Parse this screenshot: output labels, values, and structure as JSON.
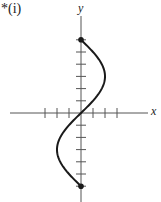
{
  "part_label": "*(i)",
  "chart_data": {
    "type": "line",
    "title": "",
    "xlabel": "x",
    "ylabel": "y",
    "xlim": [
      -3,
      3
    ],
    "ylim": [
      -6,
      6
    ],
    "x_ticks": [
      -3,
      -2,
      -1,
      1,
      2,
      3
    ],
    "y_ticks": [
      -6,
      -5,
      -4,
      -3,
      -2,
      -1,
      1,
      2,
      3,
      4,
      5,
      6
    ],
    "tick_labels_shown": false,
    "grid": false,
    "curve": "x = 2 sin(pi*y/6), -6 <= y <= 6",
    "series": [
      {
        "name": "curve",
        "points": [
          [
            0,
            -6
          ],
          [
            -1,
            -5
          ],
          [
            -1.73,
            -4
          ],
          [
            -2,
            -3
          ],
          [
            -1.73,
            -2
          ],
          [
            -1,
            -1
          ],
          [
            0,
            0
          ],
          [
            1,
            1
          ],
          [
            1.73,
            2
          ],
          [
            2,
            3
          ],
          [
            1.73,
            4
          ],
          [
            1,
            5
          ],
          [
            0,
            6
          ]
        ]
      }
    ],
    "endpoints": [
      [
        0,
        6
      ],
      [
        0,
        -6
      ]
    ],
    "colors": {
      "axis": "#555555",
      "curve": "#1a1a1a"
    }
  }
}
